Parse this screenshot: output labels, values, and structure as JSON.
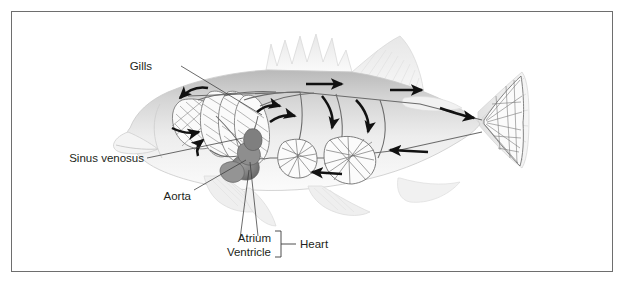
{
  "figure": {
    "background_color": "#ffffff",
    "border_color": "#6e6e6e",
    "ink_color": "#231f20"
  },
  "labels": {
    "gills": "Gills",
    "sinus_venosus": "Sinus venosus",
    "aorta": "Aorta",
    "atrium": "Atrium",
    "ventricle": "Ventricle",
    "heart": "Heart"
  },
  "structures": {
    "fish_body": "fish-body",
    "gill_arches": "gill-arches",
    "heart_mass": "heart-mass",
    "capillary_beds": "capillary-beds",
    "dorsal_aorta": "dorsal-aorta",
    "ventral_vessel": "ventral-vessel",
    "tail_capillaries": "tail-capillary-network"
  },
  "flow_arrows": {
    "count": 11,
    "description": "blood flow direction arrows",
    "color": "#111111"
  },
  "colors": {
    "body_light": "#f1f1f1",
    "body_mid": "#d8d8d8",
    "body_dark": "#b6b6b6",
    "vessel": "#6e6e6e",
    "heart_dark": "#8c8c8c",
    "heart_darker": "#6a6a6a",
    "leader_line": "#4a4a4a"
  }
}
